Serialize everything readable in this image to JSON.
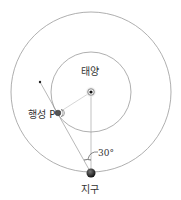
{
  "diagram": {
    "title_partial": "",
    "labels": {
      "sun": "태양",
      "planet": "행성 P",
      "earth": "지구",
      "angle": "30°"
    },
    "geometry": {
      "sun_center": [
        91,
        92
      ],
      "inner_orbit_radius": 40,
      "outer_orbit_radius": 80,
      "earth_position": [
        91,
        173
      ],
      "planet_position": [
        58,
        113
      ],
      "sight_line_end": [
        40,
        82
      ],
      "elongation_angle_deg": 30
    },
    "colors": {
      "orbit": "#9a9a9a",
      "line": "#8a8a8a",
      "body": "#333333",
      "text": "#333333"
    }
  }
}
